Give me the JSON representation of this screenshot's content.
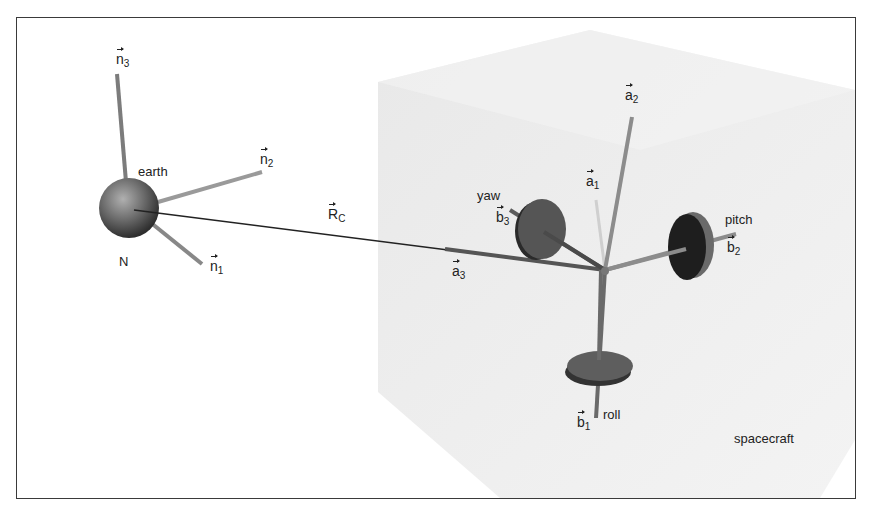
{
  "figure": {
    "earth": {
      "label": "earth",
      "frame_label": "N",
      "axes": [
        {
          "base": "n",
          "sub": "1"
        },
        {
          "base": "n",
          "sub": "2"
        },
        {
          "base": "n",
          "sub": "3"
        }
      ]
    },
    "position_vector": {
      "base": "R",
      "sub": "C"
    },
    "spacecraft": {
      "label": "spacecraft",
      "axes": [
        {
          "base": "a",
          "sub": "1"
        },
        {
          "base": "a",
          "sub": "2"
        },
        {
          "base": "a",
          "sub": "3"
        }
      ]
    },
    "wheels": [
      {
        "name": "roll",
        "axis": {
          "base": "b",
          "sub": "1"
        }
      },
      {
        "name": "pitch",
        "axis": {
          "base": "b",
          "sub": "2"
        }
      },
      {
        "name": "yaw",
        "axis": {
          "base": "b",
          "sub": "3"
        }
      }
    ],
    "colors": {
      "border": "#3a3a3a",
      "cube_fill": "#ececec",
      "axis_rod": "#8a8a8a",
      "wheel": "#5a5a5a",
      "pitch_wheel": "#1e1e1e",
      "earth": "#6e6e6e",
      "text": "#222222"
    }
  }
}
